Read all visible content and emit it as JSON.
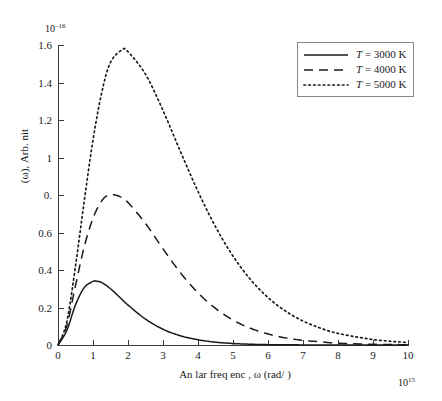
{
  "figure": {
    "background_color": "#ffffff",
    "axis_color": "#3a3a3a",
    "curve_color": "#1a1a1a"
  },
  "axes": {
    "y": {
      "title": "(ω), Arb. nit",
      "exponent_mantissa": "10",
      "exponent_power": "–16",
      "tick_labels": [
        "0",
        "0.2",
        "0.4",
        "0.6",
        "0.",
        "1",
        "1.2",
        "1.4",
        "1.6"
      ],
      "tick_values": [
        0,
        0.2,
        0.4,
        0.6,
        0.8,
        1.0,
        1.2,
        1.4,
        1.6
      ],
      "min": 0,
      "max": 1.6
    },
    "x": {
      "title": "An   lar freq enc  , ω (rad/ )",
      "exponent_mantissa": "10",
      "exponent_power": "15",
      "tick_labels": [
        "0",
        "1",
        "2",
        "3",
        "4",
        "5",
        "6",
        "7",
        "8",
        "9",
        "10"
      ],
      "tick_values": [
        0,
        1,
        2,
        3,
        4,
        5,
        6,
        7,
        8,
        9,
        10
      ],
      "min": 0,
      "max": 10
    }
  },
  "legend": {
    "position": "top-right",
    "entries": [
      {
        "label": "T = 3000 K",
        "symbol": "T",
        "equals": " = ",
        "value": "3000 K",
        "style": "solid"
      },
      {
        "label": "T = 4000 K",
        "symbol": "T",
        "equals": " = ",
        "value": "4000 K",
        "style": "dashed"
      },
      {
        "label": "T = 5000 K",
        "symbol": "T",
        "equals": " = ",
        "value": "5000 K",
        "style": "dotted"
      }
    ]
  },
  "chart_data": {
    "type": "line",
    "title": "",
    "xlabel": "An   lar freq enc  , ω (rad/ )",
    "ylabel": "(ω), Arb. nit",
    "xlim": [
      0,
      10
    ],
    "ylim": [
      0,
      1.6
    ],
    "x_scale_exponent": 15,
    "y_scale_exponent": -16,
    "grid": false,
    "legend_position": "top-right",
    "series": [
      {
        "name": "T = 3000 K",
        "temperature_K": 3000,
        "style": "solid",
        "peak_x": 1.1,
        "peak_y": 0.34,
        "x": [
          0,
          0.25,
          0.5,
          0.75,
          1.0,
          1.1,
          1.25,
          1.5,
          1.75,
          2.0,
          2.5,
          3.0,
          3.5,
          4.0,
          4.5,
          5.0,
          5.5,
          6.0,
          6.5,
          7.0,
          8.0,
          9.0,
          10.0
        ],
        "y": [
          0,
          0.077,
          0.214,
          0.306,
          0.339,
          0.34,
          0.333,
          0.3,
          0.257,
          0.213,
          0.138,
          0.084,
          0.049,
          0.028,
          0.015,
          0.008,
          0.004,
          0.002,
          0.001,
          0.0006,
          0.0002,
          5e-05,
          1e-05
        ]
      },
      {
        "name": "T = 4000 K",
        "temperature_K": 4000,
        "style": "dashed",
        "peak_x": 1.47,
        "peak_y": 0.8,
        "x": [
          0,
          0.25,
          0.5,
          0.75,
          1.0,
          1.25,
          1.47,
          1.75,
          2.0,
          2.5,
          3.0,
          3.5,
          4.0,
          4.5,
          5.0,
          5.5,
          6.0,
          6.5,
          7.0,
          8.0,
          9.0,
          10.0
        ],
        "y": [
          0,
          0.102,
          0.317,
          0.524,
          0.676,
          0.769,
          0.801,
          0.793,
          0.76,
          0.648,
          0.513,
          0.385,
          0.278,
          0.195,
          0.133,
          0.089,
          0.059,
          0.038,
          0.025,
          0.01,
          0.004,
          0.0015
        ]
      },
      {
        "name": "T = 5000 K",
        "temperature_K": 5000,
        "style": "dotted",
        "peak_x": 1.84,
        "peak_y": 1.575,
        "x": [
          0,
          0.25,
          0.5,
          0.75,
          1.0,
          1.25,
          1.5,
          1.84,
          2.0,
          2.5,
          3.0,
          3.5,
          4.0,
          4.5,
          5.0,
          5.5,
          6.0,
          6.5,
          7.0,
          7.5,
          8.0,
          9.0,
          10.0
        ],
        "y": [
          0,
          0.123,
          0.42,
          0.768,
          1.093,
          1.347,
          1.508,
          1.575,
          1.564,
          1.444,
          1.251,
          1.031,
          0.819,
          0.631,
          0.474,
          0.349,
          0.253,
          0.181,
          0.128,
          0.09,
          0.062,
          0.029,
          0.013
        ]
      }
    ]
  }
}
